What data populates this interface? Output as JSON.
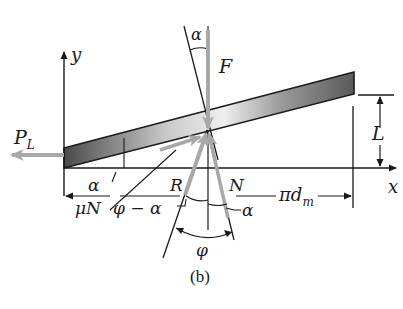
{
  "figure": {
    "caption": "(b)",
    "labels": {
      "y_axis": "y",
      "x_axis": "x",
      "load_force": "P",
      "load_force_sub": "L",
      "applied_force": "F",
      "lead": "L",
      "alpha_top": "α",
      "alpha_left": "α",
      "alpha_bottom": "α",
      "resultant": "R",
      "normal": "N",
      "friction": "μN",
      "phi_minus_alpha": "φ − α",
      "circumference_pi": "π",
      "circumference_d": "d",
      "circumference_sub": "m",
      "phi": "φ"
    },
    "colors": {
      "line": "#1a1a1a",
      "force_arrow": "#a8a8a8",
      "bar_dark": "#5a5a5a",
      "bar_light": "#e6e6e6"
    }
  }
}
